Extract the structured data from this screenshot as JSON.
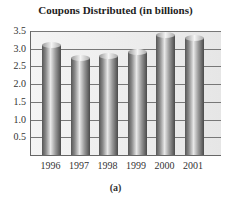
{
  "chart_data": {
    "type": "bar",
    "title": "Coupons Distributed (in billions)",
    "categories": [
      "1996",
      "1997",
      "1998",
      "1999",
      "2000",
      "2001"
    ],
    "values": [
      3.1,
      2.75,
      2.8,
      2.9,
      3.4,
      3.3
    ],
    "xlabel": "",
    "ylabel": "",
    "ylim": [
      0,
      3.5
    ],
    "yticks": [
      "0.5",
      "1.0",
      "1.5",
      "2.0",
      "2.5",
      "3.0",
      "3.5"
    ],
    "grid": true,
    "caption": "(a)"
  }
}
